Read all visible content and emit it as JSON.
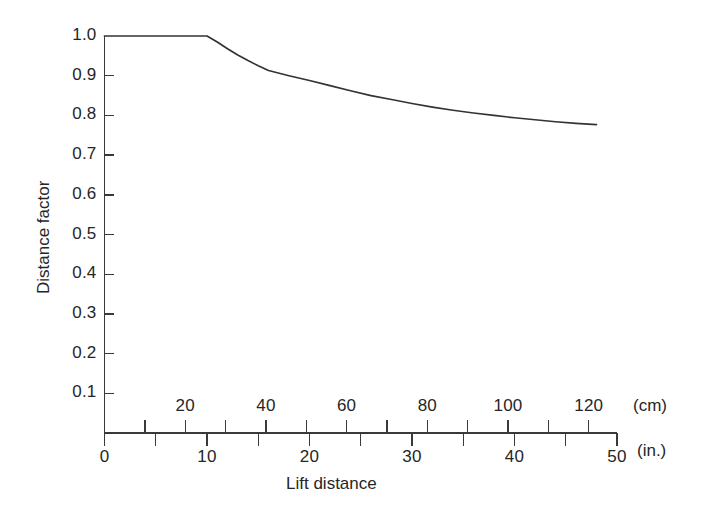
{
  "figure": {
    "background_color": "#ffffff",
    "line_color": "#333333",
    "axis_color": "#3a3a3a",
    "text_color": "#262626"
  },
  "axes": {
    "y_title": "Distance factor",
    "x_title": "Lift distance",
    "unit_primary": "(in.)",
    "unit_secondary": "(cm)"
  },
  "chart_data": {
    "type": "line",
    "title": "",
    "subtitle": "",
    "xlabel": "Lift distance",
    "ylabel": "Distance factor",
    "grid": false,
    "legend": "none",
    "annotations": [],
    "x_units": {
      "primary": "in.",
      "secondary": "cm",
      "conversion_in_to_cm": 2.54
    },
    "xlim_in": [
      0,
      50
    ],
    "ylim": [
      0.0,
      1.0
    ],
    "x_ticks_in_major": [
      0,
      10,
      20,
      30,
      40,
      50
    ],
    "x_ticks_in_minor": [
      5,
      15,
      25,
      35,
      45
    ],
    "x_tick_labels_in": [
      "0",
      "10",
      "20",
      "30",
      "40",
      "50"
    ],
    "x_ticks_cm_major": [
      20,
      40,
      60,
      80,
      100,
      120
    ],
    "x_ticks_cm_minor": [
      10,
      30,
      50,
      70,
      90,
      110
    ],
    "x_tick_labels_cm": [
      "20",
      "40",
      "60",
      "80",
      "100",
      "120"
    ],
    "y_ticks": [
      0.1,
      0.2,
      0.3,
      0.4,
      0.5,
      0.6,
      0.7,
      0.8,
      0.9,
      1.0
    ],
    "y_tick_labels": [
      "0.1",
      "0.2",
      "0.3",
      "0.4",
      "0.5",
      "0.6",
      "0.7",
      "0.8",
      "0.9",
      "1.0"
    ],
    "series": [
      {
        "name": "Distance factor",
        "x": [
          0,
          2,
          4,
          6,
          8,
          10,
          11,
          12,
          13,
          14,
          15,
          16,
          18,
          20,
          22,
          24,
          26,
          28,
          30,
          32,
          34,
          36,
          38,
          40,
          42,
          44,
          46,
          48
        ],
        "y": [
          1.0,
          1.0,
          1.0,
          1.0,
          1.0,
          1.0,
          0.985,
          0.968,
          0.952,
          0.938,
          0.925,
          0.913,
          0.9,
          0.888,
          0.875,
          0.862,
          0.85,
          0.84,
          0.83,
          0.821,
          0.813,
          0.806,
          0.8,
          0.794,
          0.789,
          0.784,
          0.78,
          0.777
        ]
      }
    ],
    "breakpoint_in": 10,
    "plateau_value": 1.0,
    "asymptote_value": 0.777
  }
}
